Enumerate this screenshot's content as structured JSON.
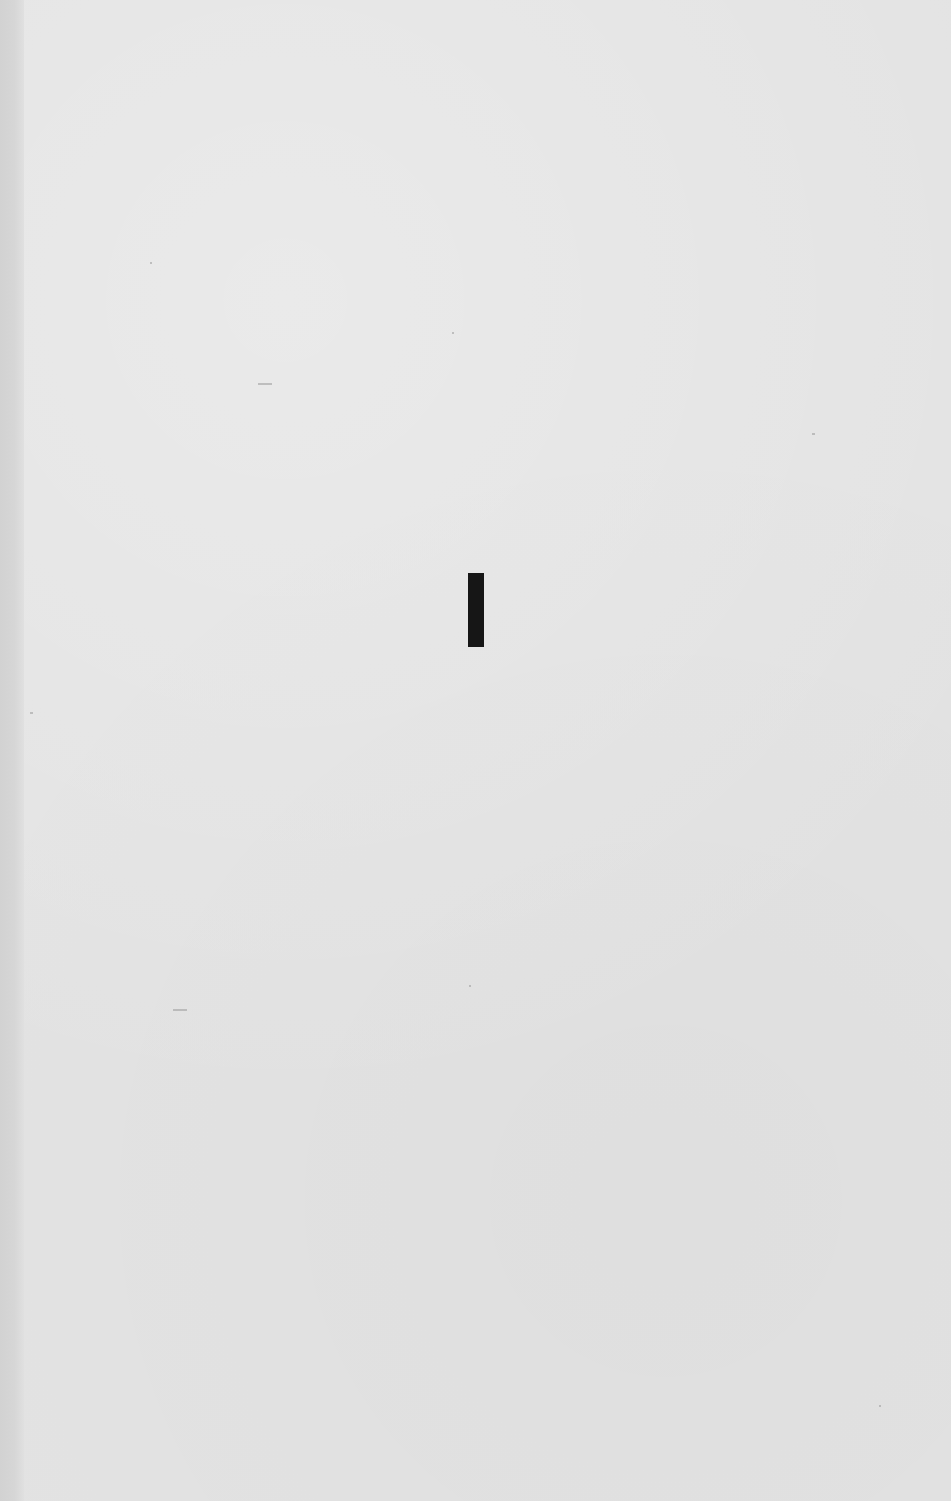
{
  "page": {
    "type": "scanned-book-page",
    "background_color": "#e3e3e3",
    "ink_color": "#161616",
    "content": {
      "section_numeral": "I"
    }
  }
}
